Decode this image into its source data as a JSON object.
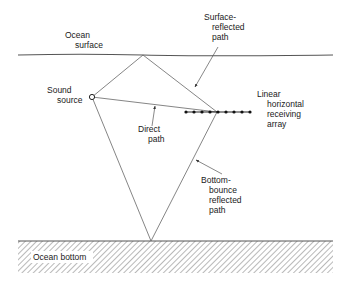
{
  "diagram": {
    "type": "multipath sound propagation",
    "labels": {
      "ocean_surface": [
        "Ocean",
        "surface"
      ],
      "sound_source": [
        "Sound",
        "source"
      ],
      "surface_reflected_path": [
        "Surface-",
        "reflected",
        "path"
      ],
      "direct_path": [
        "Direct",
        "path"
      ],
      "receiving_array": [
        "Linear",
        "horizontal",
        "receiving",
        "array"
      ],
      "bottom_bounce_path": [
        "Bottom-",
        "bounce",
        "reflected",
        "path"
      ],
      "ocean_bottom": "Ocean bottom"
    },
    "geometry": {
      "surface_y": 55,
      "surface_x_range": [
        18,
        333
      ],
      "bottom_y": 241,
      "bottom_x_range": [
        18,
        333
      ],
      "source": [
        92,
        97
      ],
      "surface_reflection_point": [
        143,
        55
      ],
      "bottom_reflection_point": [
        151,
        241
      ],
      "array_center": [
        217,
        112
      ],
      "array_x_range": [
        185,
        251
      ],
      "array_element_count": 9
    },
    "colors": {
      "line": "#555555",
      "text": "#1a1a1a",
      "hatch": "#888888"
    }
  }
}
